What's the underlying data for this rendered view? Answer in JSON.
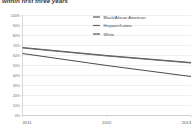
{
  "chart_data": {
    "type": "line",
    "title": "within first three years",
    "xlabel": "",
    "ylabel": "",
    "x": [
      "2011",
      "2012",
      "2013"
    ],
    "xtick_labels": [
      "2011",
      "2012",
      "2013"
    ],
    "ytick_labels": [
      "0%",
      "10%",
      "20%",
      "30%",
      "40%",
      "50%",
      "60%",
      "70%",
      "80%",
      "90%",
      "100%"
    ],
    "ylim": [
      0,
      100
    ],
    "ytick_values": [
      0,
      10,
      20,
      30,
      40,
      50,
      60,
      70,
      80,
      90,
      100
    ],
    "grid": true,
    "legend_position": "top-right",
    "series": [
      {
        "name": "Black/African American",
        "color": "#555555",
        "values": [
          68,
          60,
          53
        ]
      },
      {
        "name": "Hispanic/Latino",
        "color": "#666666",
        "values": [
          67.5,
          59.5,
          52.5
        ]
      },
      {
        "name": "White",
        "color": "#4f4f4f",
        "values": [
          62,
          50,
          39
        ]
      }
    ]
  },
  "legend": {
    "items": [
      {
        "label": "Black/African American"
      },
      {
        "label": "Hispanic/Latino"
      },
      {
        "label": "White"
      }
    ]
  },
  "axis": {
    "y_labels": [
      "100%",
      "90%",
      "80%",
      "70%",
      "60%",
      "50%",
      "40%",
      "30%",
      "20%",
      "10%",
      "0%"
    ],
    "x_labels": [
      "2011",
      "2012",
      "2013"
    ]
  },
  "colors": {
    "grid": "#d9d9d9",
    "axis": "#b0b0b0",
    "text": "#4a4a4a",
    "line_dark": "#555555"
  }
}
